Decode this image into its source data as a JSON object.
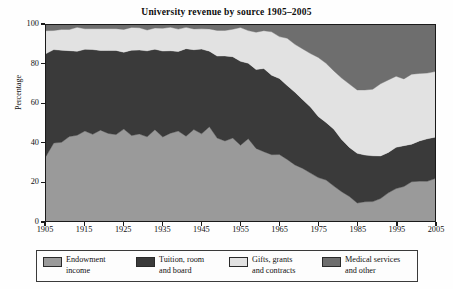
{
  "chart_data": {
    "type": "area",
    "stacked": true,
    "title": "University revenue by source 1905–2005",
    "xlabel": "",
    "ylabel": "Percentage",
    "xlim": [
      1905,
      2005
    ],
    "ylim": [
      0,
      100
    ],
    "grid": false,
    "legend_position": "bottom",
    "xticks": [
      "1905",
      "1915",
      "1925",
      "1935",
      "1945",
      "1955",
      "1965",
      "1975",
      "1985",
      "1995",
      "2005"
    ],
    "yticks": [
      "0",
      "20",
      "40",
      "60",
      "80",
      "100"
    ],
    "x": [
      1905,
      1907,
      1909,
      1911,
      1913,
      1915,
      1917,
      1919,
      1921,
      1923,
      1925,
      1927,
      1929,
      1931,
      1933,
      1935,
      1937,
      1939,
      1941,
      1943,
      1945,
      1947,
      1949,
      1951,
      1953,
      1955,
      1957,
      1959,
      1961,
      1963,
      1965,
      1967,
      1969,
      1971,
      1973,
      1975,
      1977,
      1979,
      1981,
      1983,
      1985,
      1987,
      1989,
      1991,
      1993,
      1995,
      1997,
      1999,
      2001,
      2003,
      2005
    ],
    "series": [
      {
        "name": "Endowment income",
        "color": "#9a9a9a",
        "values": [
          34,
          39,
          41,
          43,
          44,
          46,
          44,
          47,
          45,
          44,
          46,
          43,
          45,
          42,
          46,
          43,
          44,
          46,
          43,
          47,
          44,
          48,
          42,
          41,
          43,
          39,
          42,
          38,
          36,
          34,
          33,
          31,
          29,
          27,
          25,
          22,
          20,
          17,
          15,
          12,
          9,
          9,
          10,
          12,
          14,
          16,
          18,
          20,
          21,
          21,
          22
        ]
      },
      {
        "name": "Tuition, room and board",
        "color": "#3a3a3a",
        "values": [
          52,
          48,
          46,
          44,
          43,
          41,
          43,
          40,
          42,
          43,
          41,
          44,
          42,
          45,
          41,
          44,
          43,
          41,
          44,
          40,
          43,
          38,
          43,
          43,
          40,
          43,
          38,
          40,
          41,
          41,
          40,
          38,
          37,
          35,
          33,
          32,
          30,
          29,
          27,
          26,
          25,
          24,
          23,
          22,
          21,
          21,
          20,
          20,
          20,
          20,
          20
        ]
      },
      {
        "name": "Gifts, grants and contracts",
        "color": "#e2e2e2",
        "values": [
          12,
          11,
          11,
          11,
          11,
          11,
          11,
          11,
          11,
          11,
          11,
          11,
          11,
          11,
          11,
          11,
          11,
          11,
          11,
          11,
          11,
          12,
          13,
          14,
          15,
          16,
          17,
          19,
          20,
          21,
          22,
          24,
          25,
          26,
          28,
          29,
          30,
          30,
          31,
          32,
          33,
          34,
          35,
          36,
          37,
          36,
          35,
          34,
          34,
          34,
          34
        ]
      },
      {
        "name": "Medical services and other",
        "color": "#6e6e6e",
        "values": [
          2,
          2,
          2,
          2,
          2,
          2,
          2,
          2,
          2,
          2,
          2,
          2,
          2,
          2,
          2,
          2,
          2,
          2,
          2,
          2,
          2,
          2,
          2,
          2,
          2,
          2,
          3,
          3,
          3,
          4,
          5,
          7,
          9,
          12,
          14,
          17,
          20,
          24,
          27,
          30,
          33,
          33,
          32,
          30,
          28,
          27,
          27,
          26,
          25,
          25,
          24
        ]
      }
    ]
  },
  "legend": {
    "items": [
      {
        "label_line1": "Endowment",
        "label_line2": "income"
      },
      {
        "label_line1": "Tuition, room",
        "label_line2": "and board"
      },
      {
        "label_line1": "Gifts, grants",
        "label_line2": "and contracts"
      },
      {
        "label_line1": "Medical services",
        "label_line2": "and other"
      }
    ]
  }
}
